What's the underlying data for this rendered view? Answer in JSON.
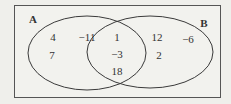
{
  "diagram": {
    "type": "venn",
    "universe_box": true,
    "sets": [
      {
        "name": "A",
        "label_pos": [
          33,
          19
        ]
      },
      {
        "name": "B",
        "label_pos": [
          204,
          23
        ]
      }
    ],
    "regions": {
      "A_only": [
        {
          "value": "4",
          "pos": [
            53,
            37
          ]
        },
        {
          "value": "−11",
          "pos": [
            87,
            37
          ]
        },
        {
          "value": "7",
          "pos": [
            52,
            55
          ]
        }
      ],
      "A_and_B": [
        {
          "value": "1",
          "pos": [
            117,
            37
          ]
        },
        {
          "value": "−3",
          "pos": [
            117,
            54
          ]
        },
        {
          "value": "18",
          "pos": [
            117,
            71
          ]
        }
      ],
      "B_only": [
        {
          "value": "12",
          "pos": [
            157,
            37
          ]
        },
        {
          "value": "−6",
          "pos": [
            188,
            39
          ]
        },
        {
          "value": "2",
          "pos": [
            159,
            55
          ]
        }
      ]
    },
    "colors": {
      "background": "#efefeb",
      "stroke": "#3a3a3a",
      "text": "#333333"
    }
  }
}
